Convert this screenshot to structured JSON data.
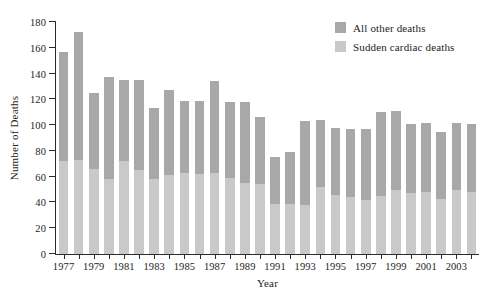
{
  "chart_data": {
    "type": "bar",
    "subtype": "stacked-vertical",
    "title": "",
    "subtitle": "",
    "xlabel": "Year",
    "ylabel": "Number of Deaths",
    "ylim": [
      0,
      180
    ],
    "ytick_step": 20,
    "ytick_labels": [
      "0",
      "20",
      "40",
      "60",
      "80",
      "100",
      "120",
      "140",
      "160",
      "180"
    ],
    "grid": false,
    "legend_position": "top-right",
    "x": [
      1977,
      1978,
      1979,
      1980,
      1981,
      1982,
      1983,
      1984,
      1985,
      1986,
      1987,
      1988,
      1989,
      1990,
      1991,
      1992,
      1993,
      1994,
      1995,
      1996,
      1997,
      1998,
      1999,
      2000,
      2001,
      2002,
      2003,
      2004
    ],
    "xtick_labels": [
      "1977",
      "",
      "1979",
      "",
      "1981",
      "",
      "1983",
      "",
      "1985",
      "",
      "1987",
      "",
      "1989",
      "",
      "1991",
      "",
      "1993",
      "",
      "1995",
      "",
      "1997",
      "",
      "1999",
      "",
      "2001",
      "",
      "2003",
      ""
    ],
    "series": [
      {
        "name": "Sudden cardiac deaths",
        "color": "#c9c9c9",
        "values": [
          72,
          73,
          66,
          58,
          72,
          65,
          58,
          61,
          63,
          62,
          63,
          59,
          55,
          54,
          39,
          39,
          38,
          52,
          46,
          44,
          42,
          45,
          50,
          47,
          48,
          43,
          50,
          48
        ]
      },
      {
        "name": "All other deaths",
        "color": "#a8a8a8",
        "values": [
          85,
          99,
          59,
          79,
          63,
          70,
          55,
          66,
          56,
          57,
          71,
          59,
          63,
          52,
          36,
          40,
          65,
          52,
          52,
          53,
          55,
          65,
          61,
          54,
          54,
          52,
          52,
          53
        ]
      }
    ],
    "totals": [
      157,
      172,
      125,
      137,
      135,
      135,
      113,
      127,
      119,
      119,
      134,
      118,
      118,
      106,
      75,
      79,
      103,
      104,
      98,
      97,
      97,
      110,
      111,
      101,
      102,
      95,
      102,
      101
    ]
  },
  "legend": {
    "entries": [
      {
        "label": "All other deaths",
        "color": "#a8a8a8"
      },
      {
        "label": "Sudden cardiac deaths",
        "color": "#c9c9c9"
      }
    ]
  },
  "axes": {
    "y_title": "Number of Deaths",
    "x_title": "Year"
  }
}
